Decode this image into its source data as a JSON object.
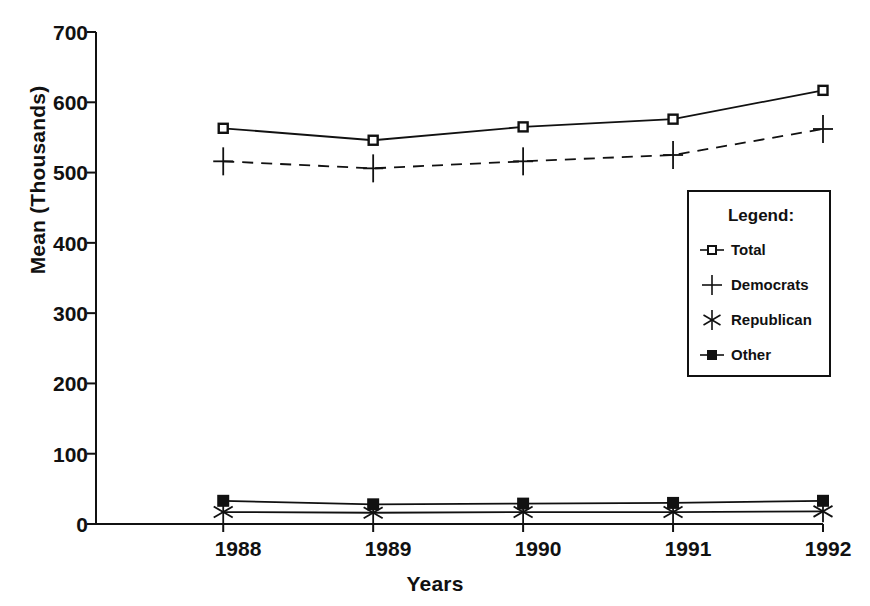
{
  "chart_data": {
    "type": "line",
    "title": "",
    "xlabel": "Years",
    "ylabel": "Mean (Thousands)",
    "categories": [
      "1988",
      "1989",
      "1990",
      "1991",
      "1992"
    ],
    "xticklabels": [
      "1988",
      "1989",
      "1990",
      "1991",
      "1992"
    ],
    "yticklabels": [
      "0",
      "100",
      "200",
      "300",
      "400",
      "500",
      "600",
      "700"
    ],
    "ytickvalues": [
      0,
      100,
      200,
      300,
      400,
      500,
      600,
      700
    ],
    "ylim": [
      0,
      700
    ],
    "grid": false,
    "legend_position": "inside-right",
    "legend_title": "Legend:",
    "series": [
      {
        "name": "Total",
        "marker": "open-square",
        "line": "solid",
        "values": [
          563,
          546,
          565,
          576,
          617
        ]
      },
      {
        "name": "Democrats",
        "marker": "plus",
        "line": "dashed",
        "values": [
          516,
          506,
          516,
          525,
          562
        ]
      },
      {
        "name": "Republican",
        "marker": "asterisk",
        "line": "solid",
        "values": [
          17,
          16,
          17,
          17,
          18
        ]
      },
      {
        "name": "Other",
        "marker": "filled-square",
        "line": "solid",
        "values": [
          33,
          28,
          29,
          30,
          33
        ]
      }
    ]
  },
  "axes": {
    "y_title": "Mean (Thousands)",
    "x_title": "Years",
    "y_ticks": [
      "700",
      "600",
      "500",
      "400",
      "300",
      "200",
      "100",
      "0"
    ],
    "x_ticks": [
      "1988",
      "1989",
      "1990",
      "1991",
      "1992"
    ]
  },
  "legend": {
    "title": "Legend:",
    "items": [
      {
        "label": "Total",
        "icon": "open-square-marker-icon"
      },
      {
        "label": "Democrats",
        "icon": "plus-marker-icon"
      },
      {
        "label": "Republican",
        "icon": "asterisk-marker-icon"
      },
      {
        "label": "Other",
        "icon": "filled-square-marker-icon"
      }
    ]
  },
  "colors": {
    "ink": "#111111",
    "background": "#ffffff"
  }
}
